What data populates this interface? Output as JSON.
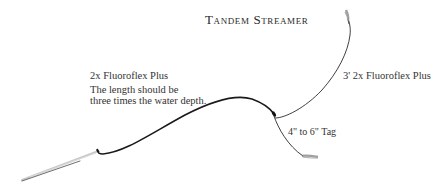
{
  "diagram": {
    "title": "Tandem Streamer",
    "labels": {
      "main_line": "2x Fluoroflex Plus",
      "main_note_line1": "The length should be",
      "main_note_line2": "three times the water depth.",
      "upper_line": "3' 2x Fluoroflex Plus",
      "tag": "4\" to 6\" Tag"
    },
    "elements": [
      {
        "name": "fly-rod",
        "description": "rod tip at lower left"
      },
      {
        "name": "main-line",
        "description": "thick 2x Fluoroflex Plus line from rod tip to knot"
      },
      {
        "name": "knot",
        "description": "blood knot junction"
      },
      {
        "name": "upper-line",
        "description": "3 ft 2x Fluoroflex Plus to upper fly"
      },
      {
        "name": "tag-line",
        "description": "4 to 6 inch tag to lower fly"
      },
      {
        "name": "upper-fly",
        "description": "streamer fly at end of upper line"
      },
      {
        "name": "tag-fly",
        "description": "streamer fly at end of tag"
      }
    ],
    "colors": {
      "line": "#1a1a1a",
      "rod": "#9a9a9a",
      "text": "#333333"
    }
  }
}
